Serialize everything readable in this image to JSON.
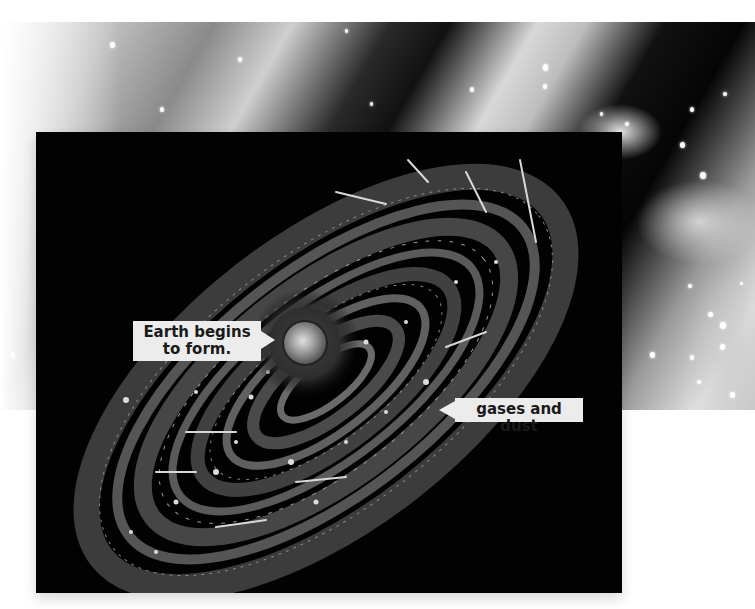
{
  "figure": {
    "background_photo": {
      "description": "grayscale photograph of interstellar gas clouds and stars"
    },
    "illustration": {
      "description": "spiral cloud of gas and dust around young Sun with forming Earth"
    },
    "labels": {
      "earth": "Earth begins to form.",
      "earth_line1": "Earth begins",
      "earth_line2": "to form.",
      "gases": "gases and dust"
    },
    "colors": {
      "panel_bg": "#020202",
      "label_bg": "#ececec",
      "label_text": "#1a1a1a",
      "page_bg": "#ffffff"
    }
  }
}
